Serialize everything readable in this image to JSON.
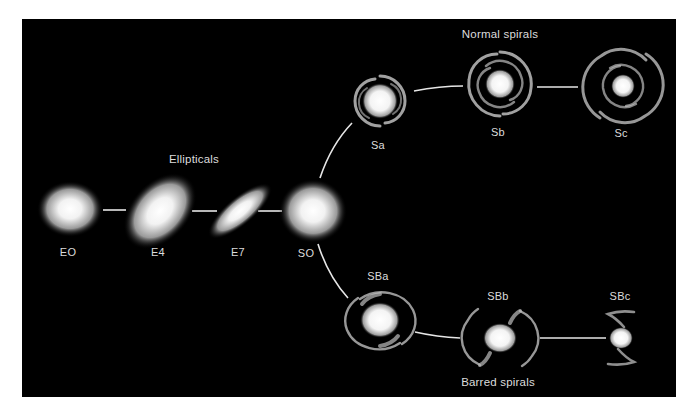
{
  "diagram": {
    "background_color": "#000000",
    "line_color": "#e6e6e6",
    "text_color": "#dcdcdc",
    "groups": {
      "ellipticals": "Ellipticals",
      "normal_spirals": "Normal spirals",
      "barred_spirals": "Barred spirals"
    },
    "galaxies": {
      "e0": "EO",
      "e4": "E4",
      "e7": "E7",
      "s0": "SO",
      "sa": "Sa",
      "sb": "Sb",
      "sc": "Sc",
      "sba": "SBa",
      "sbb": "SBb",
      "sbc": "SBc"
    }
  }
}
